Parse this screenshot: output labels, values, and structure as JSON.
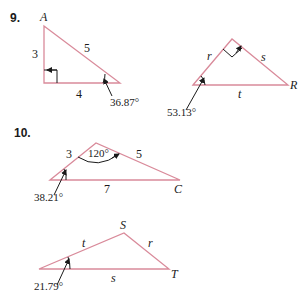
{
  "problems": [
    {
      "number": "9.",
      "triangles": [
        {
          "vertex_label": "A",
          "sides": {
            "left": "3",
            "hyp": "5",
            "bottom": "4"
          },
          "angle": "36.87°"
        },
        {
          "vertex_label": "R",
          "sides": {
            "left": "r",
            "right": "s",
            "bottom": "t"
          },
          "angle": "53.13°"
        }
      ]
    },
    {
      "number": "10.",
      "triangles": [
        {
          "vertex_label": "C",
          "sides": {
            "left": "3",
            "right": "5",
            "bottom": "7"
          },
          "top_angle": "120°",
          "angle": "38.21°"
        },
        {
          "vertex_top": "S",
          "vertex_label": "T",
          "sides": {
            "left": "t",
            "right": "r",
            "bottom": "s"
          },
          "angle": "21.79°"
        }
      ]
    }
  ],
  "colors": {
    "triangle_stroke": "#d98a9a",
    "text": "#1a1a1a"
  }
}
